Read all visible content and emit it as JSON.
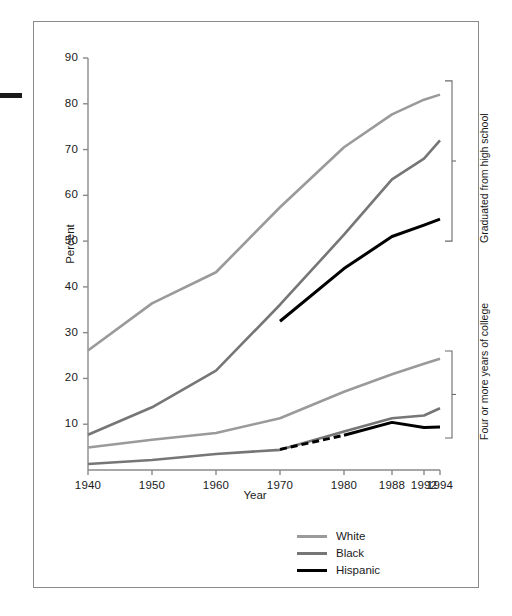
{
  "chart_data": {
    "type": "line",
    "title": "",
    "xlabel": "Year",
    "ylabel": "Percent",
    "xlim": [
      1940,
      1994
    ],
    "ylim": [
      0,
      90
    ],
    "ytick_labels": [
      "90",
      "80",
      "70",
      "60",
      "50",
      "40",
      "30",
      "20",
      "10"
    ],
    "ytick_values": [
      90,
      80,
      70,
      60,
      50,
      40,
      30,
      20,
      10
    ],
    "xtick_labels": [
      "1940",
      "1950",
      "1960",
      "1970",
      "1980",
      "1988",
      "1992",
      "1994"
    ],
    "xtick_values": [
      1940,
      1950,
      1960,
      1970,
      1980,
      1988,
      1992,
      1994
    ],
    "grid": false,
    "legend_position": "bottom-right",
    "legend": [
      {
        "name": "White",
        "color": "#9a9a9a"
      },
      {
        "name": "Black",
        "color": "#767676"
      },
      {
        "name": "Hispanic",
        "color": "#000000"
      }
    ],
    "group_brackets": [
      {
        "label": "Graduated from high school",
        "y_top": 85.0,
        "y_bottom": 50.0
      },
      {
        "label": "Four or more years of college",
        "y_top": 26.0,
        "y_bottom": 7.0
      }
    ],
    "series": [
      {
        "name": "White - Graduated from high school",
        "group": "Graduated from high school",
        "color": "#9a9a9a",
        "style": "solid",
        "x": [
          1940,
          1950,
          1960,
          1970,
          1980,
          1988,
          1992,
          1994
        ],
        "values": [
          26.1,
          36.4,
          43.2,
          57.4,
          70.5,
          77.7,
          80.9,
          82.0
        ]
      },
      {
        "name": "Black - Graduated from high school",
        "group": "Graduated from high school",
        "color": "#767676",
        "style": "solid",
        "x": [
          1940,
          1950,
          1960,
          1970,
          1980,
          1988,
          1992,
          1994
        ],
        "values": [
          7.7,
          13.7,
          21.7,
          36.1,
          51.4,
          63.5,
          68.0,
          72.0
        ]
      },
      {
        "name": "Hispanic - Graduated from high school",
        "group": "Graduated from high school",
        "color": "#000000",
        "style": "solid",
        "x": [
          1970,
          1980,
          1988,
          1992,
          1994
        ],
        "values": [
          32.5,
          44.0,
          51.0,
          53.5,
          54.8
        ]
      },
      {
        "name": "White - Four or more years of college",
        "group": "Four or more years of college",
        "color": "#9a9a9a",
        "style": "solid",
        "x": [
          1940,
          1950,
          1960,
          1970,
          1980,
          1988,
          1992,
          1994
        ],
        "values": [
          4.9,
          6.6,
          8.1,
          11.3,
          17.1,
          20.9,
          23.2,
          24.3
        ]
      },
      {
        "name": "Black - Four or more years of college",
        "group": "Four or more years of college",
        "color": "#767676",
        "style": "solid",
        "x": [
          1940,
          1950,
          1960,
          1970,
          1980,
          1988,
          1992,
          1994
        ],
        "values": [
          1.3,
          2.2,
          3.5,
          4.4,
          8.4,
          11.3,
          11.9,
          13.5
        ]
      },
      {
        "name": "Hispanic - Four or more years of college (estimated)",
        "group": "Four or more years of college",
        "color": "#000000",
        "style": "dashed",
        "x": [
          1970,
          1980
        ],
        "values": [
          4.5,
          7.6
        ]
      },
      {
        "name": "Hispanic - Four or more years of college",
        "group": "Four or more years of college",
        "color": "#000000",
        "style": "solid",
        "x": [
          1980,
          1988,
          1992,
          1994
        ],
        "values": [
          7.6,
          10.4,
          9.3,
          9.4
        ]
      }
    ]
  }
}
